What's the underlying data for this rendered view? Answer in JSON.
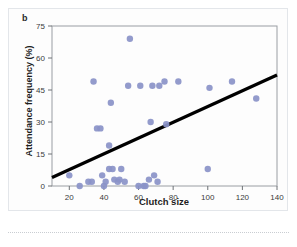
{
  "figure": {
    "panel_label": "b",
    "background_color": "#fdfdfd",
    "frame_color": "#e3e6ea"
  },
  "chart_data": {
    "type": "scatter",
    "title": "",
    "subtitle": "",
    "xlabel": "Clutch size",
    "ylabel": "Attendance frequency (%)",
    "xlim": [
      10,
      140
    ],
    "ylim": [
      0,
      75
    ],
    "xticks": [
      20,
      40,
      60,
      80,
      100,
      120,
      140
    ],
    "yticks": [
      0,
      15,
      30,
      45,
      60,
      75
    ],
    "grid": false,
    "legend": null,
    "marker_color": "#8a92c8",
    "line_color": "#000000",
    "points": [
      {
        "x": 20,
        "y": 5
      },
      {
        "x": 26,
        "y": 0
      },
      {
        "x": 31,
        "y": 2
      },
      {
        "x": 33,
        "y": 2
      },
      {
        "x": 34,
        "y": 49
      },
      {
        "x": 36,
        "y": 27
      },
      {
        "x": 38,
        "y": 27
      },
      {
        "x": 39,
        "y": 5
      },
      {
        "x": 40,
        "y": 0
      },
      {
        "x": 41,
        "y": 2
      },
      {
        "x": 43,
        "y": 19
      },
      {
        "x": 43,
        "y": 8
      },
      {
        "x": 44,
        "y": 39
      },
      {
        "x": 45,
        "y": 8
      },
      {
        "x": 46,
        "y": 3
      },
      {
        "x": 48,
        "y": 2
      },
      {
        "x": 49,
        "y": 3
      },
      {
        "x": 50,
        "y": 8
      },
      {
        "x": 52,
        "y": 2
      },
      {
        "x": 54,
        "y": 47
      },
      {
        "x": 55,
        "y": 69
      },
      {
        "x": 60,
        "y": 0
      },
      {
        "x": 61,
        "y": 47
      },
      {
        "x": 63,
        "y": 0
      },
      {
        "x": 64,
        "y": 0
      },
      {
        "x": 66,
        "y": 3
      },
      {
        "x": 67,
        "y": 30
      },
      {
        "x": 68,
        "y": 47
      },
      {
        "x": 69,
        "y": 5
      },
      {
        "x": 71,
        "y": 2
      },
      {
        "x": 72,
        "y": 47
      },
      {
        "x": 75,
        "y": 49
      },
      {
        "x": 76,
        "y": 29
      },
      {
        "x": 83,
        "y": 49
      },
      {
        "x": 100,
        "y": 8
      },
      {
        "x": 101,
        "y": 46
      },
      {
        "x": 114,
        "y": 49
      },
      {
        "x": 128,
        "y": 41
      }
    ],
    "trendline": {
      "type": "linear",
      "x_start": 10,
      "y_start": 4,
      "x_end": 140,
      "y_end": 52
    }
  }
}
